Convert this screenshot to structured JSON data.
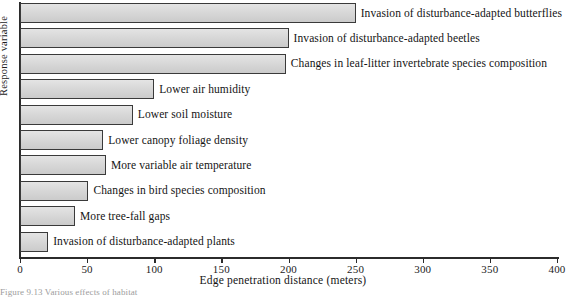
{
  "chart_data": {
    "type": "bar",
    "orientation": "horizontal",
    "title": "",
    "xlabel": "Edge penetration distance (meters)",
    "ylabel": "Response variable",
    "xlim": [
      0,
      400
    ],
    "xticks": [
      0,
      50,
      100,
      150,
      200,
      250,
      300,
      350,
      400
    ],
    "xtick_labels": [
      "0",
      "50",
      "100",
      "150",
      "200",
      "250",
      "300",
      "350",
      "400"
    ],
    "grid": false,
    "legend": null,
    "categories": [
      "Invasion of disturbance-adapted butterflies",
      "Invasion of disturbance-adapted beetles",
      "Changes in leaf-litter invertebrate species composition",
      "Lower air humidity",
      "Lower soil moisture",
      "Lower canopy foliage density",
      "More variable air temperature",
      "Changes in bird species composition",
      "More tree-fall gaps",
      "Invasion of disturbance-adapted plants"
    ],
    "values": [
      250,
      200,
      198,
      100,
      84,
      62,
      64,
      51,
      41,
      21
    ],
    "bar_fill_color": "#d7d7d7",
    "bar_edge_color": "#3a3a3a",
    "axis_color": "#2b2b2b"
  },
  "caption": {
    "text": "Figure 9.13  Various effects of habitat"
  }
}
